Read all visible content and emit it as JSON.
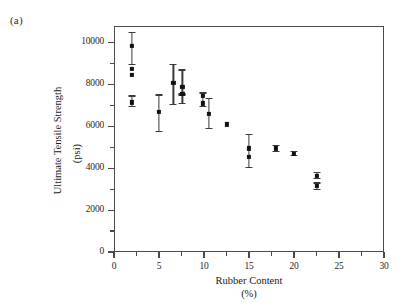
{
  "figure": {
    "panel_label": "(a)",
    "background_color": "#ffffff",
    "axis_color": "#4a4a4a",
    "marker_color": "#111111"
  },
  "chart_data": {
    "type": "scatter",
    "title": "",
    "subtitle": "",
    "panel": "(a)",
    "xlabel": "Rubber Content",
    "xunit": "(%)",
    "ylabel": "Ultimate Tensile Strength",
    "yunit": "(psi)",
    "xlim": [
      0,
      30
    ],
    "ylim": [
      0,
      10800
    ],
    "xticks": [
      0,
      5,
      10,
      15,
      20,
      25,
      30
    ],
    "xticklabels": [
      "0",
      "5",
      "10",
      "15",
      "20",
      "25",
      "30"
    ],
    "xminorticks": [
      2.5,
      7.5,
      12.5,
      17.5,
      22.5,
      27.5
    ],
    "yticks": [
      0,
      2000,
      4000,
      6000,
      8000,
      10000
    ],
    "yticklabels": [
      "0",
      "2000",
      "4000",
      "6000",
      "8000",
      "10000"
    ],
    "yminorticks": [
      1000,
      3000,
      5000,
      7000,
      9000
    ],
    "grid": false,
    "legend": null,
    "errorbar_direction": "vertical",
    "points": [
      {
        "x": 2.0,
        "y": 9850,
        "yerr_low": 8950,
        "yerr_high": 10500
      },
      {
        "x": 2.0,
        "y": 8750,
        "yerr_low": 8750,
        "yerr_high": 8750
      },
      {
        "x": 2.0,
        "y": 8450,
        "yerr_low": 8450,
        "yerr_high": 8450
      },
      {
        "x": 2.0,
        "y": 7150,
        "yerr_low": 6950,
        "yerr_high": 7450
      },
      {
        "x": 5.0,
        "y": 6700,
        "yerr_low": 5750,
        "yerr_high": 7500
      },
      {
        "x": 6.6,
        "y": 8100,
        "yerr_low": 7050,
        "yerr_high": 8950
      },
      {
        "x": 7.6,
        "y": 7900,
        "yerr_low": 7500,
        "yerr_high": 8700
      },
      {
        "x": 7.6,
        "y": 7550,
        "yerr_low": 7100,
        "yerr_high": 7550
      },
      {
        "x": 9.9,
        "y": 7450,
        "yerr_low": 6950,
        "yerr_high": 7600
      },
      {
        "x": 9.9,
        "y": 7100,
        "yerr_low": 7100,
        "yerr_high": 7100
      },
      {
        "x": 10.5,
        "y": 6600,
        "yerr_low": 5900,
        "yerr_high": 7350
      },
      {
        "x": 12.5,
        "y": 6100,
        "yerr_low": 6100,
        "yerr_high": 6100
      },
      {
        "x": 15.0,
        "y": 4950,
        "yerr_low": 4050,
        "yerr_high": 5600
      },
      {
        "x": 15.0,
        "y": 4550,
        "yerr_low": 4550,
        "yerr_high": 4550
      },
      {
        "x": 18.0,
        "y": 4950,
        "yerr_low": 4800,
        "yerr_high": 5100
      },
      {
        "x": 20.0,
        "y": 4700,
        "yerr_low": 4600,
        "yerr_high": 4800
      },
      {
        "x": 22.5,
        "y": 3650,
        "yerr_low": 3500,
        "yerr_high": 3800
      },
      {
        "x": 22.5,
        "y": 3150,
        "yerr_low": 3000,
        "yerr_high": 3300
      }
    ]
  }
}
